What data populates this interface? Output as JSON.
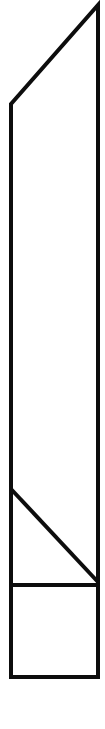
{
  "figure": {
    "background_color": "#ffffff",
    "stroke_color": "#0d0d0d",
    "stroke_width": 4,
    "canvas": {
      "width": 105,
      "height": 729
    },
    "outline": {
      "type": "polygon",
      "comment": "pentagon: right-top apex, right-bottom, left-bottom, left-top; closing edge is the long top bevel",
      "points": [
        [
          98,
          5
        ],
        [
          98,
          677
        ],
        [
          11,
          677
        ],
        [
          11,
          104
        ]
      ]
    },
    "inner_lines": [
      {
        "name": "lower-diagonal",
        "x1": 11,
        "y1": 489,
        "x2": 98,
        "y2": 582
      },
      {
        "name": "horizontal-divider",
        "x1": 9,
        "y1": 585,
        "x2": 100,
        "y2": 585
      }
    ]
  }
}
